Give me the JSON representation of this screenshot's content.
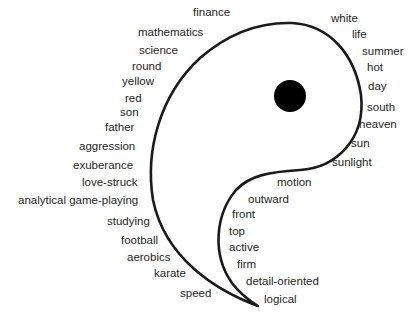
{
  "diagram": {
    "title": "",
    "shape": "yang half of yin-yang (teardrop outline with black dot)",
    "colors": {
      "outline": "#1a1a1a",
      "dot": "#000000",
      "text": "#1e1e1e",
      "background": "#ffffff"
    },
    "left_labels": [
      {
        "text": "finance",
        "x": 193,
        "y": 12
      },
      {
        "text": "mathematics",
        "x": 138,
        "y": 32
      },
      {
        "text": "science",
        "x": 139,
        "y": 50
      },
      {
        "text": "round",
        "x": 132,
        "y": 66
      },
      {
        "text": "yellow",
        "x": 122,
        "y": 81
      },
      {
        "text": "red",
        "x": 125,
        "y": 98
      },
      {
        "text": "son",
        "x": 120,
        "y": 112
      },
      {
        "text": "father",
        "x": 105,
        "y": 127
      },
      {
        "text": "aggression",
        "x": 79,
        "y": 146
      },
      {
        "text": "exuberance",
        "x": 73,
        "y": 165
      },
      {
        "text": "love-struck",
        "x": 82,
        "y": 182
      },
      {
        "text": "analytical game-playing",
        "x": 18,
        "y": 200
      },
      {
        "text": "studying",
        "x": 107,
        "y": 221
      },
      {
        "text": "football",
        "x": 121,
        "y": 240
      },
      {
        "text": "aerobics",
        "x": 127,
        "y": 257
      },
      {
        "text": "karate",
        "x": 154,
        "y": 273
      },
      {
        "text": "speed",
        "x": 180,
        "y": 293
      }
    ],
    "right_labels": [
      {
        "text": "white",
        "x": 331,
        "y": 18
      },
      {
        "text": "life",
        "x": 352,
        "y": 34
      },
      {
        "text": "summer",
        "x": 362,
        "y": 51
      },
      {
        "text": "hot",
        "x": 367,
        "y": 67
      },
      {
        "text": "day",
        "x": 368,
        "y": 86
      },
      {
        "text": "south",
        "x": 367,
        "y": 107
      },
      {
        "text": "heaven",
        "x": 359,
        "y": 124
      },
      {
        "text": "sun",
        "x": 351,
        "y": 143
      },
      {
        "text": "sunlight",
        "x": 332,
        "y": 162
      }
    ],
    "inner_labels": [
      {
        "text": "motion",
        "x": 277,
        "y": 182
      },
      {
        "text": "outward",
        "x": 248,
        "y": 199
      },
      {
        "text": "front",
        "x": 232,
        "y": 214
      },
      {
        "text": "top",
        "x": 229,
        "y": 231
      },
      {
        "text": "active",
        "x": 229,
        "y": 247
      },
      {
        "text": "firm",
        "x": 237,
        "y": 264
      },
      {
        "text": "detail-oriented",
        "x": 246,
        "y": 281
      },
      {
        "text": "logical",
        "x": 264,
        "y": 299
      }
    ],
    "dot": {
      "cx": 290,
      "cy": 96,
      "r": 16
    }
  }
}
